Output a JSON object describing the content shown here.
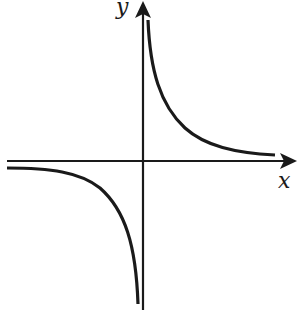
{
  "diagram": {
    "type": "function-graph",
    "axes": {
      "x_label": "x",
      "y_label": "y",
      "origin_px": [
        143,
        161
      ]
    },
    "branches": [
      {
        "name": "quadrant-I-branch",
        "quadrant": 1
      },
      {
        "name": "quadrant-III-branch",
        "quadrant": 3
      }
    ],
    "colors": {
      "stroke": "#1a1a1a",
      "background": "#ffffff"
    }
  }
}
